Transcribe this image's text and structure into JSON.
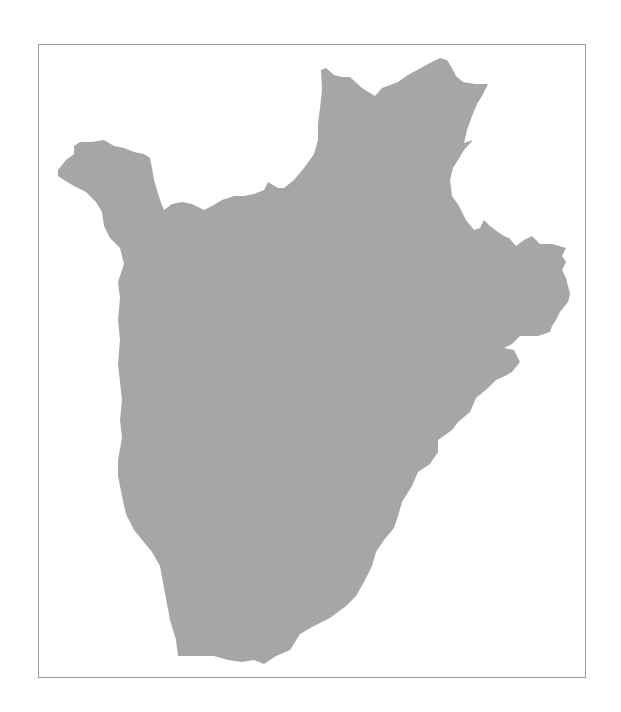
{
  "map": {
    "country": "Burundi",
    "fill_color": "#a6a6a6",
    "frame_color": "#9a9a9a",
    "background": "#ffffff",
    "labels": []
  }
}
